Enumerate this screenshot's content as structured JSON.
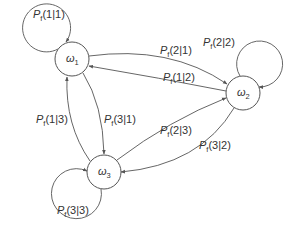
{
  "diagram": {
    "type": "markov-transition-graph",
    "nodes": [
      {
        "id": "w1",
        "symbol": "ω",
        "index": "1",
        "cx": 72,
        "cy": 59,
        "r": 17
      },
      {
        "id": "w2",
        "symbol": "ω",
        "index": "2",
        "cx": 243,
        "cy": 93,
        "r": 17
      },
      {
        "id": "w3",
        "symbol": "ω",
        "index": "3",
        "cx": 104,
        "cy": 172,
        "r": 17
      }
    ],
    "edges": [
      {
        "id": "e11",
        "from": "w1",
        "to": "w1",
        "label_p": "P",
        "label_sub": "f",
        "label_args": "(1|1)"
      },
      {
        "id": "e22",
        "from": "w2",
        "to": "w2",
        "label_p": "P",
        "label_sub": "f",
        "label_args": "(2|2)"
      },
      {
        "id": "e33",
        "from": "w3",
        "to": "w3",
        "label_p": "P",
        "label_sub": "f",
        "label_args": "(3|3)"
      },
      {
        "id": "e21",
        "from": "w1",
        "to": "w2",
        "label_p": "P",
        "label_sub": "f",
        "label_args": "(2|1)"
      },
      {
        "id": "e12",
        "from": "w2",
        "to": "w1",
        "label_p": "P",
        "label_sub": "f",
        "label_args": "(1|2)"
      },
      {
        "id": "e31",
        "from": "w1",
        "to": "w3",
        "label_p": "P",
        "label_sub": "f",
        "label_args": "(3|1)"
      },
      {
        "id": "e13",
        "from": "w3",
        "to": "w1",
        "label_p": "P",
        "label_sub": "f",
        "label_args": "(1|3)"
      },
      {
        "id": "e23",
        "from": "w3",
        "to": "w2",
        "label_p": "P",
        "label_sub": "f",
        "label_args": "(2|3)"
      },
      {
        "id": "e32",
        "from": "w2",
        "to": "w3",
        "label_p": "P",
        "label_sub": "f",
        "label_args": "(3|2)"
      }
    ],
    "colors": {
      "stroke": "#555555",
      "text": "#333333",
      "background": "#ffffff"
    }
  }
}
